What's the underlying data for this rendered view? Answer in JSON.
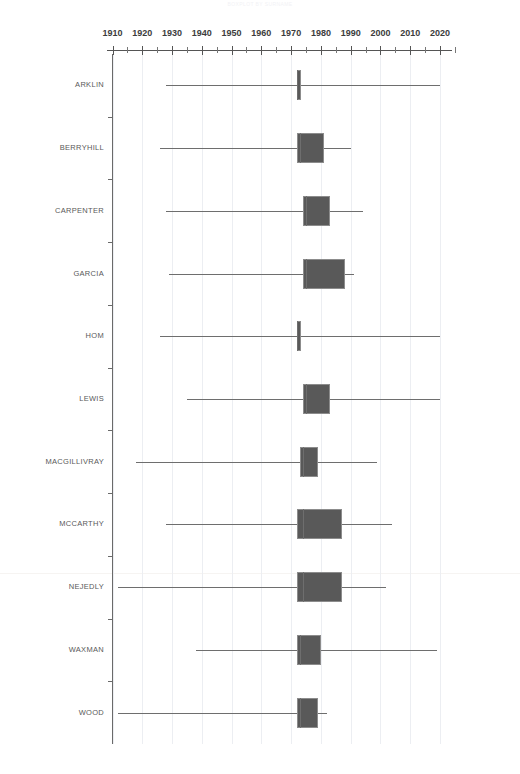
{
  "chart_title": "BOXPLOT BY SURNAME",
  "chart_data": {
    "type": "box",
    "title": "BOXPLOT BY SURNAME",
    "xlabel": "",
    "ylabel": "",
    "orientation": "horizontal",
    "xlim": [
      1905,
      2025
    ],
    "grid": true,
    "legend": "none",
    "xticks": [
      "1910",
      "1920",
      "1930",
      "1940",
      "1950",
      "1960",
      "1970",
      "1980",
      "1990",
      "2000",
      "2010",
      "2020"
    ],
    "xtick_values": [
      1910,
      1920,
      1930,
      1940,
      1950,
      1960,
      1970,
      1980,
      1990,
      2000,
      2010,
      2020
    ],
    "minor_tick_interval": 5,
    "categories": [
      "ARKLIN",
      "BERRYHILL",
      "CARPENTER",
      "GARCIA",
      "HOM",
      "LEWIS",
      "MACGILLIVRAY",
      "MCCARTHY",
      "NEJEDLY",
      "WAXMAN",
      "WOOD"
    ],
    "boxes": [
      {
        "category": "ARKLIN",
        "whisker_low": 1928,
        "q1": 1972,
        "median": 1972,
        "q3": 1973,
        "whisker_high": 2020
      },
      {
        "category": "BERRYHILL",
        "whisker_low": 1926,
        "q1": 1972,
        "median": 1973,
        "q3": 1981,
        "whisker_high": 1990
      },
      {
        "category": "CARPENTER",
        "whisker_low": 1928,
        "q1": 1974,
        "median": 1975,
        "q3": 1983,
        "whisker_high": 1994
      },
      {
        "category": "GARCIA",
        "whisker_low": 1929,
        "q1": 1974,
        "median": 1975,
        "q3": 1988,
        "whisker_high": 1991
      },
      {
        "category": "HOM",
        "whisker_low": 1926,
        "q1": 1972,
        "median": 1972,
        "q3": 1973,
        "whisker_high": 2020
      },
      {
        "category": "LEWIS",
        "whisker_low": 1935,
        "q1": 1974,
        "median": 1975,
        "q3": 1983,
        "whisker_high": 2020
      },
      {
        "category": "MACGILLIVRAY",
        "whisker_low": 1918,
        "q1": 1973,
        "median": 1974,
        "q3": 1979,
        "whisker_high": 1999
      },
      {
        "category": "MCCARTHY",
        "whisker_low": 1928,
        "q1": 1972,
        "median": 1974,
        "q3": 1987,
        "whisker_high": 2004
      },
      {
        "category": "NEJEDLY",
        "whisker_low": 1912,
        "q1": 1972,
        "median": 1974,
        "q3": 1987,
        "whisker_high": 2002
      },
      {
        "category": "WAXMAN",
        "whisker_low": 1938,
        "q1": 1972,
        "median": 1973,
        "q3": 1980,
        "whisker_high": 2019
      },
      {
        "category": "WOOD",
        "whisker_low": 1912,
        "q1": 1972,
        "median": 1973,
        "q3": 1979,
        "whisker_high": 1982
      }
    ]
  }
}
